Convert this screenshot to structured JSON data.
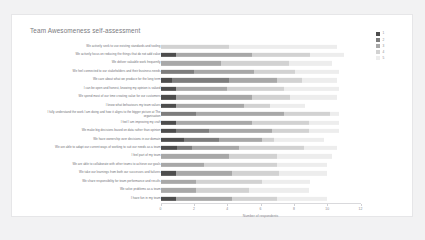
{
  "card": {
    "title": "Team Awesomeness self-assessment"
  },
  "chart_data": {
    "type": "bar",
    "orientation": "horizontal",
    "stacked": true,
    "title": "Team Awesomeness self-assessment",
    "xlabel": "Number of respondents",
    "ylabel": "",
    "xlim": [
      0,
      12
    ],
    "xticks": [
      0,
      2,
      4,
      6,
      8,
      10,
      12
    ],
    "grid": false,
    "legend": {
      "position": "right",
      "title": "",
      "entries": [
        {
          "label": "1",
          "color": "#4d4d4d"
        },
        {
          "label": "2",
          "color": "#7d7d7d"
        },
        {
          "label": "3",
          "color": "#a8a8a8"
        },
        {
          "label": "4",
          "color": "#d2d2d2"
        },
        {
          "label": "5",
          "color": "#ededed"
        }
      ]
    },
    "series": [
      {
        "name": "1",
        "color": "#4d4d4d"
      },
      {
        "name": "2",
        "color": "#7d7d7d"
      },
      {
        "name": "3",
        "color": "#a8a8a8"
      },
      {
        "name": "4",
        "color": "#d2d2d2"
      },
      {
        "name": "5",
        "color": "#ededed"
      }
    ],
    "categories": [
      "We actively seek to use existing standards and tooling",
      "We actively focus on reducing the things that do not add value",
      "We deliver valuable work frequently",
      "We feel connected to our stakeholders and their business needs",
      "We care about what we produce for the long term",
      "I can be open and honest, knowing my opinion is valued",
      "We spend most of our time creating value for our customers",
      "I know what behaviours my team values",
      "I fully understand the work I am doing and how it aligns to the bigger picture at The organisation",
      "I feel I am improving my craft",
      "We make big decisions based on data rather than opinion",
      "We have ownership over decisions in our domain",
      "We are able to adapt our current ways of working to suit our needs as a team",
      "I feel part of my team",
      "We are able to collaborate with other teams to achieve our goals",
      "We take our learnings from both our successes and failures",
      "We share responsibility for team performance and results",
      "We solve problems as a team",
      "I have fun in my team"
    ],
    "rows": [
      {
        "category": "We actively seek to use existing standards and tooling",
        "values": [
          0.0,
          0.0,
          0.0,
          4.1,
          6.5
        ]
      },
      {
        "category": "We actively focus on reducing the things that do not add value",
        "values": [
          0.9,
          0.0,
          4.6,
          3.5,
          2.0
        ]
      },
      {
        "category": "We deliver valuable work frequently",
        "values": [
          0.0,
          0.0,
          3.6,
          4.1,
          2.6
        ]
      },
      {
        "category": "We feel connected to our stakeholders and their business needs",
        "values": [
          0.0,
          2.0,
          3.6,
          2.5,
          2.6
        ]
      },
      {
        "category": "We care about what we produce for the long term",
        "values": [
          0.7,
          3.4,
          2.9,
          1.5,
          2.1
        ]
      },
      {
        "category": "I can be open and honest, knowing my opinion is valued",
        "values": [
          0.9,
          0.0,
          3.1,
          3.4,
          3.3
        ]
      },
      {
        "category": "We spend most of our time creating value for our customers",
        "values": [
          0.9,
          0.0,
          4.6,
          2.3,
          2.8
        ]
      },
      {
        "category": "I know what behaviours my team values",
        "values": [
          0.9,
          0.0,
          4.1,
          1.6,
          2.1
        ]
      },
      {
        "category": "I fully understand the work I am doing and how it aligns to the bigger picture at The organisation",
        "values": [
          0.0,
          2.1,
          5.3,
          2.8,
          0.5
        ]
      },
      {
        "category": "I feel I am improving my craft",
        "values": [
          0.9,
          0.0,
          4.6,
          3.4,
          1.8
        ]
      },
      {
        "category": "We make big decisions based on data rather than opinion",
        "values": [
          0.9,
          2.0,
          3.8,
          2.2,
          1.8
        ]
      },
      {
        "category": "We have ownership over decisions in our domain",
        "values": [
          1.4,
          2.1,
          2.6,
          0.7,
          3.0
        ]
      },
      {
        "category": "We are able to adapt our current ways of working to suit our needs as a team",
        "values": [
          1.0,
          0.9,
          2.8,
          3.9,
          2.0
        ]
      },
      {
        "category": "I feel part of my team",
        "values": [
          0.0,
          0.0,
          4.1,
          2.9,
          3.3
        ]
      },
      {
        "category": "We are able to collaborate with other teams to achieve our goals",
        "values": [
          0.0,
          0.0,
          2.6,
          4.4,
          3.0
        ]
      },
      {
        "category": "We take our learnings from both our successes and failures",
        "values": [
          0.9,
          0.0,
          3.4,
          2.8,
          2.9
        ]
      },
      {
        "category": "We share responsibility for team performance and results",
        "values": [
          0.0,
          0.0,
          2.1,
          4.0,
          2.9
        ]
      },
      {
        "category": "We solve problems as a team",
        "values": [
          0.0,
          0.0,
          2.1,
          3.2,
          3.6
        ]
      },
      {
        "category": "I have fun in my team",
        "values": [
          0.9,
          0.0,
          3.4,
          2.7,
          3.0
        ]
      }
    ]
  }
}
